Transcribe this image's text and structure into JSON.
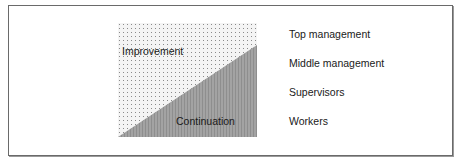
{
  "figure": {
    "regions": {
      "improvement": {
        "label": "Improvement",
        "fill": "dotted-light"
      },
      "continuation": {
        "label": "Continuation",
        "fill": "#9c9c9c"
      }
    },
    "levels": [
      {
        "label": "Top management"
      },
      {
        "label": "Middle management"
      },
      {
        "label": "Supervisors"
      },
      {
        "label": "Workers"
      }
    ],
    "colors": {
      "border": "#6a6a6a",
      "dot": "#8a8a8a",
      "continuation_fill": "#9c9c9c",
      "text": "#1a1a1a"
    }
  }
}
